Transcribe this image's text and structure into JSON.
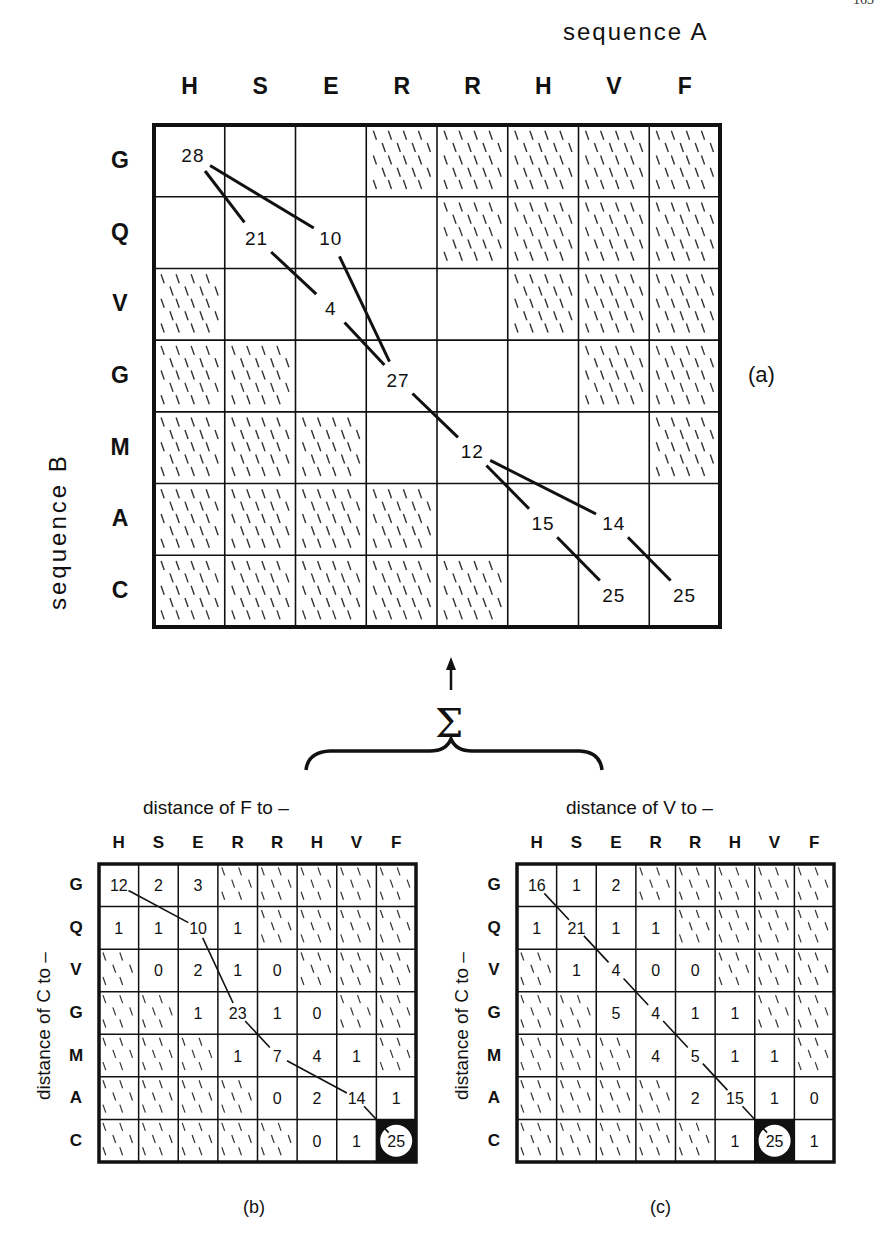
{
  "page_number": "163",
  "main_figure": {
    "label": "(a)",
    "top_axis_title": "sequence A",
    "left_axis_title": "sequence B",
    "columns": [
      "H",
      "S",
      "E",
      "R",
      "R",
      "H",
      "V",
      "F"
    ],
    "rows": [
      "G",
      "Q",
      "V",
      "G",
      "M",
      "A",
      "C"
    ],
    "hatched": [
      [
        0,
        0,
        0,
        1,
        1,
        1,
        1,
        1
      ],
      [
        0,
        0,
        0,
        0,
        1,
        1,
        1,
        1
      ],
      [
        1,
        0,
        0,
        0,
        0,
        1,
        1,
        1
      ],
      [
        1,
        1,
        0,
        0,
        0,
        0,
        1,
        1
      ],
      [
        1,
        1,
        1,
        0,
        0,
        0,
        0,
        1
      ],
      [
        1,
        1,
        1,
        1,
        0,
        0,
        0,
        0
      ],
      [
        1,
        1,
        1,
        1,
        1,
        0,
        0,
        0
      ]
    ],
    "values": [
      {
        "row": 0,
        "col": 0,
        "text": "28",
        "dx": 0.55,
        "dy": 0.42
      },
      {
        "row": 1,
        "col": 1,
        "text": "21",
        "dx": 0.45,
        "dy": 0.58
      },
      {
        "row": 1,
        "col": 2,
        "text": "10",
        "dx": 0.5,
        "dy": 0.58
      },
      {
        "row": 2,
        "col": 2,
        "text": "4",
        "dx": 0.5,
        "dy": 0.55
      },
      {
        "row": 3,
        "col": 3,
        "text": "27",
        "dx": 0.45,
        "dy": 0.55
      },
      {
        "row": 4,
        "col": 4,
        "text": "12",
        "dx": 0.5,
        "dy": 0.55
      },
      {
        "row": 5,
        "col": 5,
        "text": "15",
        "dx": 0.5,
        "dy": 0.55
      },
      {
        "row": 5,
        "col": 6,
        "text": "14",
        "dx": 0.5,
        "dy": 0.55
      },
      {
        "row": 6,
        "col": 6,
        "text": "25",
        "dx": 0.5,
        "dy": 0.55
      },
      {
        "row": 6,
        "col": 7,
        "text": "25",
        "dx": 0.5,
        "dy": 0.55
      }
    ],
    "paths": [
      [
        "0,0",
        "1,1",
        "2,2",
        "3,3",
        "4,4",
        "5,5",
        "6,6"
      ],
      [
        "0,0",
        "1,2",
        "3,3"
      ],
      [
        "4,4",
        "5,6",
        "6,7"
      ]
    ]
  },
  "sum_symbol": "Σ",
  "sub_figures": [
    {
      "label": "(b)",
      "title": "distance of F to –",
      "left_title": "distance of C to –",
      "columns": [
        "H",
        "S",
        "E",
        "R",
        "R",
        "H",
        "V",
        "F"
      ],
      "rows": [
        "G",
        "Q",
        "V",
        "G",
        "M",
        "A",
        "C"
      ],
      "cells": [
        [
          "12",
          "2",
          "3",
          "#",
          "#",
          "#",
          "#",
          "#"
        ],
        [
          "1",
          "1",
          "10",
          "1",
          "#",
          "#",
          "#",
          "#"
        ],
        [
          "#",
          "0",
          "2",
          "1",
          "0",
          "#",
          "#",
          "#"
        ],
        [
          "#",
          "#",
          "1",
          "23",
          "1",
          "0",
          "#",
          "#"
        ],
        [
          "#",
          "#",
          "#",
          "1",
          "7",
          "4",
          "1",
          "#"
        ],
        [
          "#",
          "#",
          "#",
          "#",
          "0",
          "2",
          "14",
          "1"
        ],
        [
          "#",
          "#",
          "#",
          "#",
          "#",
          "0",
          "1",
          "25"
        ]
      ],
      "highlight": {
        "row": 6,
        "col": 7
      },
      "path": [
        "0,0",
        "1,2",
        "3,3",
        "4,4",
        "5,6",
        "6,7"
      ]
    },
    {
      "label": "(c)",
      "title": "distance of V to –",
      "left_title": "distance of C to –",
      "columns": [
        "H",
        "S",
        "E",
        "R",
        "R",
        "H",
        "V",
        "F"
      ],
      "rows": [
        "G",
        "Q",
        "V",
        "G",
        "M",
        "A",
        "C"
      ],
      "cells": [
        [
          "16",
          "1",
          "2",
          "#",
          "#",
          "#",
          "#",
          "#"
        ],
        [
          "1",
          "21",
          "1",
          "1",
          "#",
          "#",
          "#",
          "#"
        ],
        [
          "#",
          "1",
          "4",
          "0",
          "0",
          "#",
          "#",
          "#"
        ],
        [
          "#",
          "#",
          "5",
          "4",
          "1",
          "1",
          "#",
          "#"
        ],
        [
          "#",
          "#",
          "#",
          "4",
          "5",
          "1",
          "1",
          "#"
        ],
        [
          "#",
          "#",
          "#",
          "#",
          "2",
          "15",
          "1",
          "0"
        ],
        [
          "#",
          "#",
          "#",
          "#",
          "#",
          "1",
          "25",
          "1"
        ]
      ],
      "highlight": {
        "row": 6,
        "col": 6
      },
      "path": [
        "0,0",
        "1,1",
        "2,2",
        "3,3",
        "4,4",
        "5,5",
        "6,6"
      ]
    }
  ],
  "colors": {
    "ink": "#111111",
    "paper": "#ffffff",
    "hatch": "#333333"
  }
}
